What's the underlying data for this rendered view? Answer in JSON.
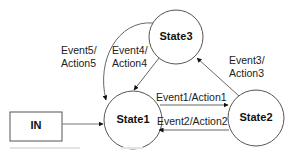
{
  "diagram": {
    "type": "state-machine",
    "start_box": {
      "label": "IN"
    },
    "states": [
      {
        "id": "state1",
        "label": "State1"
      },
      {
        "id": "state2",
        "label": "State2"
      },
      {
        "id": "state3",
        "label": "State3"
      }
    ],
    "transitions": [
      {
        "from": "IN",
        "to": "state1",
        "label": ""
      },
      {
        "from": "state1",
        "to": "state2",
        "label": "Event1/Action1"
      },
      {
        "from": "state2",
        "to": "state1",
        "label": "Event2/Action2"
      },
      {
        "from": "state2",
        "to": "state3",
        "label_line1": "Event3/",
        "label_line2": "Action3"
      },
      {
        "from": "state3",
        "to": "state1",
        "label_line1": "Event4/",
        "label_line2": "Action4"
      },
      {
        "from": "state3",
        "to": "state1",
        "label_line1": "Event5/",
        "label_line2": "Action5"
      }
    ],
    "colors": {
      "stroke": "#555555",
      "text": "#222222",
      "background": "#ffffff"
    }
  }
}
